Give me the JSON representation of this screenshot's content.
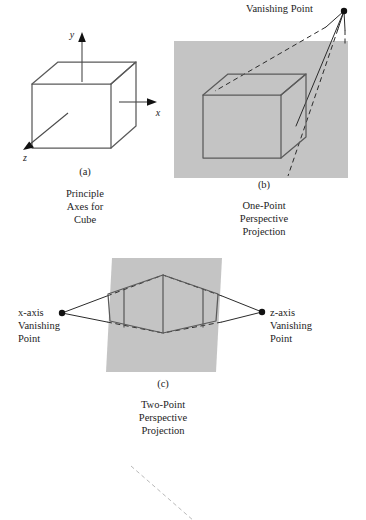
{
  "figure": {
    "background_color": "#ffffff",
    "plane_color": "#c4c4c4",
    "line_color": "#5a5a5a",
    "accent_color": "#111111"
  },
  "panel_a": {
    "tag": "(a)",
    "caption_line1": "Principle",
    "caption_line2": "Axes for",
    "caption_line3": "Cube",
    "axis_x_label": "x",
    "axis_y_label": "y",
    "axis_z_label": "z"
  },
  "panel_b": {
    "tag": "(b)",
    "caption_line1": "One-Point",
    "caption_line2": "Perspective",
    "caption_line3": "Projection",
    "vanishing_point_label": "Vanishing Point"
  },
  "panel_c": {
    "tag": "(c)",
    "caption_line1": "Two-Point",
    "caption_line2": "Perspective",
    "caption_line3": "Projection",
    "vp_left_line1": "x-axis",
    "vp_left_line2": "Vanishing",
    "vp_left_line3": "Point",
    "vp_right_line1": "z-axis",
    "vp_right_line2": "Vanishing",
    "vp_right_line3": "Point"
  }
}
